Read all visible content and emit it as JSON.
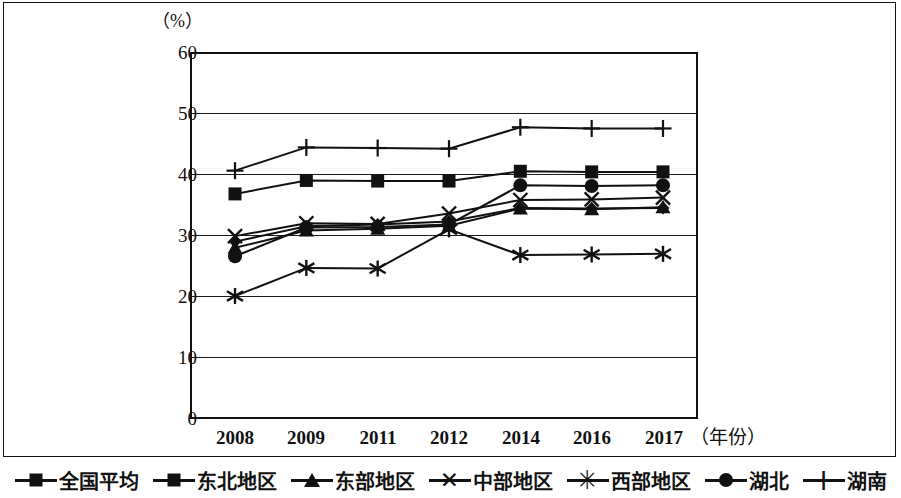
{
  "chart_data": {
    "type": "line",
    "title": "",
    "subtitle": "",
    "unit_label": "（%）",
    "xlabel": "（年份）",
    "ylabel": "",
    "categories": [
      "2008",
      "2009",
      "2011",
      "2012",
      "2014",
      "2016",
      "2017"
    ],
    "ylim": [
      0,
      60
    ],
    "yticks": [
      0,
      10,
      20,
      30,
      40,
      50,
      60
    ],
    "grid": true,
    "legend_position": "bottom",
    "series": [
      {
        "name": "全国平均",
        "marker": "diamond",
        "values": [
          29.0,
          31.5,
          31.8,
          32.3,
          34.5,
          34.4,
          34.5
        ]
      },
      {
        "name": "东北地区",
        "marker": "square",
        "values": [
          36.8,
          39.0,
          38.9,
          38.9,
          40.5,
          40.4,
          40.4
        ]
      },
      {
        "name": "东部地区",
        "marker": "triangle",
        "values": [
          28.0,
          30.8,
          31.1,
          31.6,
          34.4,
          34.3,
          34.6
        ]
      },
      {
        "name": "中部地区",
        "marker": "x",
        "values": [
          29.9,
          32.0,
          31.9,
          33.6,
          35.8,
          35.9,
          36.2
        ]
      },
      {
        "name": "西部地区",
        "marker": "star",
        "values": [
          20.1,
          24.7,
          24.6,
          31.0,
          26.8,
          26.9,
          27.0
        ]
      },
      {
        "name": "湖北",
        "marker": "circle",
        "values": [
          26.6,
          31.3,
          31.4,
          31.8,
          38.2,
          38.1,
          38.2
        ]
      },
      {
        "name": "湖南",
        "marker": "plus",
        "values": [
          40.6,
          44.4,
          44.3,
          44.2,
          47.7,
          47.5,
          47.5
        ]
      }
    ]
  },
  "axis": {
    "y_ticks": [
      "60",
      "50",
      "40",
      "30",
      "20",
      "10",
      "0"
    ],
    "x_ticks": [
      "2008",
      "2009",
      "2011",
      "2012",
      "2014",
      "2016",
      "2017"
    ],
    "unit": "（%）",
    "x_axis_title": "（年份）"
  },
  "legend": {
    "items": [
      {
        "label": "全国平均",
        "marker": "diamond-marker"
      },
      {
        "label": "东北地区",
        "marker": "square-marker"
      },
      {
        "label": "东部地区",
        "marker": "triangle-marker"
      },
      {
        "label": "中部地区",
        "marker": "x-marker"
      },
      {
        "label": "西部地区",
        "marker": "star-marker"
      },
      {
        "label": "湖北",
        "marker": "circle-marker"
      },
      {
        "label": "湖南",
        "marker": "plus-marker"
      }
    ],
    "glyphs": {
      "x": "✕",
      "star": "✳",
      "plus": "+"
    }
  },
  "colors": {
    "ink": "#111111",
    "background": "#ffffff"
  }
}
